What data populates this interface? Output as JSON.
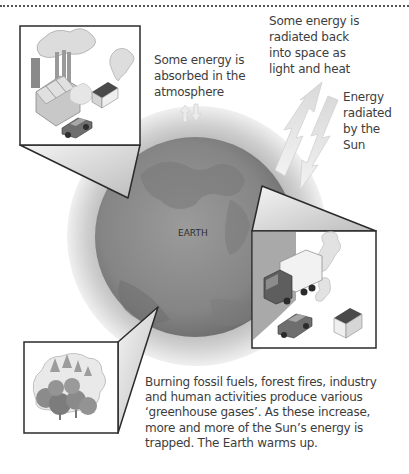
{
  "diagram": {
    "center_label": "EARTH",
    "annotations": {
      "absorbed": "Some energy is\nabsorbed in the\natmosphere",
      "radiated_back": "Some energy is\nradiated back\ninto space as\nlight and heat",
      "sun_energy": "Energy\nradiated\nby the\nSun"
    },
    "caption": "Burning fossil fuels, forest fires, industry\nand human activities produce various\n‘greenhouse gases’. As these increase,\nmore and more of the Sun’s energy is\ntrapped. The Earth warms up.",
    "insets": [
      {
        "name": "industry",
        "depicts": [
          "factory",
          "smoke",
          "house",
          "car"
        ]
      },
      {
        "name": "transport",
        "depicts": [
          "truck",
          "car",
          "house",
          "smoke"
        ]
      },
      {
        "name": "forest-fire",
        "depicts": [
          "trees",
          "smoke"
        ]
      }
    ],
    "arrows": [
      {
        "name": "incoming-solar-energy",
        "direction": "down-left"
      },
      {
        "name": "reflected-energy",
        "direction": "up-right"
      },
      {
        "name": "absorbed-energy",
        "direction": "up-down"
      }
    ],
    "colors": {
      "atmosphere": "#c9c9c9",
      "earth": "#8d8d8d",
      "earth_dark": "#6f6f6f",
      "outline": "#2b2b2b",
      "arrow": "#e6e6e6"
    }
  }
}
